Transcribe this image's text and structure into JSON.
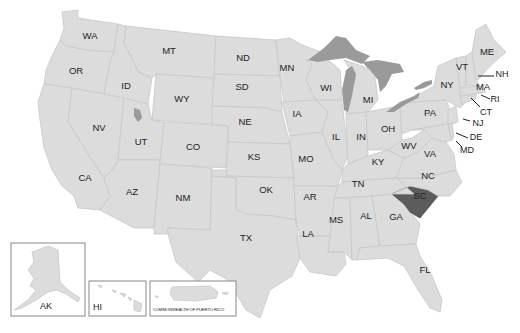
{
  "map": {
    "title": "United States map",
    "highlighted_state": "SC",
    "colors": {
      "state_fill": "#dcdcdc",
      "state_border": "#c8c8c8",
      "highlight_fill": "#5c5c5c",
      "lake_fill": "#9a9a9a"
    },
    "state_labels": {
      "WA": "WA",
      "OR": "OR",
      "CA": "CA",
      "ID": "ID",
      "NV": "NV",
      "MT": "MT",
      "WY": "WY",
      "UT": "UT",
      "AZ": "AZ",
      "CO": "CO",
      "NM": "NM",
      "ND": "ND",
      "SD": "SD",
      "NE": "NE",
      "KS": "KS",
      "OK": "OK",
      "TX": "TX",
      "MN": "MN",
      "IA": "IA",
      "MO": "MO",
      "AR": "AR",
      "LA": "LA",
      "WI": "WI",
      "IL": "IL",
      "MI": "MI",
      "IN": "IN",
      "OH": "OH",
      "KY": "KY",
      "TN": "TN",
      "MS": "MS",
      "AL": "AL",
      "GA": "GA",
      "FL": "FL",
      "SC": "SC",
      "NC": "NC",
      "VA": "VA",
      "WV": "WV",
      "PA": "PA",
      "NY": "NY",
      "VT": "VT",
      "ME": "ME",
      "NH": "NH",
      "MA": "MA",
      "RI": "RI",
      "CT": "CT",
      "NJ": "NJ",
      "DE": "DE",
      "MD": "MD"
    },
    "insets": {
      "alaska": "AK",
      "hawaii": "HI",
      "puerto_rico": "COMMONWEALTH OF PUERTO RICO"
    }
  }
}
